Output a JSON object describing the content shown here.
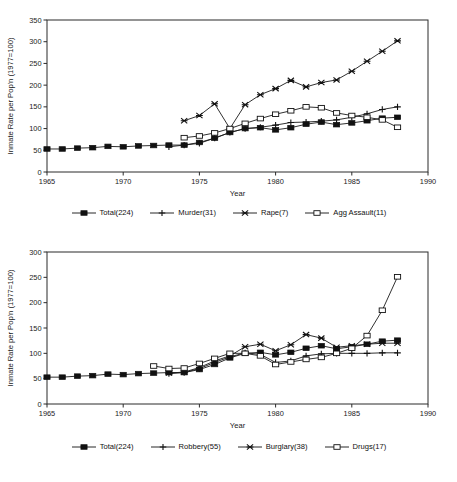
{
  "figure": {
    "background": "#ffffff",
    "ink": "#1a1a1a",
    "clipped_header_text": ""
  },
  "chart_data": [
    {
      "id": "top",
      "type": "line",
      "title": "",
      "xlabel": "Year",
      "ylabel": "Inmate Rate per Pop'n (1977=100)",
      "xlim": [
        1965,
        1990
      ],
      "ylim": [
        0,
        350
      ],
      "xticks": [
        1965,
        1970,
        1975,
        1980,
        1985,
        1990
      ],
      "yticks": [
        0,
        50,
        100,
        150,
        200,
        250,
        300,
        350
      ],
      "grid": false,
      "legend_position": "below",
      "series": [
        {
          "name": "Total(224)",
          "marker": "filled-square",
          "x": [
            1965,
            1966,
            1967,
            1968,
            1969,
            1970,
            1971,
            1972,
            1973,
            1974,
            1975,
            1976,
            1977,
            1978,
            1979,
            1980,
            1981,
            1982,
            1983,
            1984,
            1985,
            1986,
            1987,
            1988
          ],
          "values": [
            53,
            53,
            55,
            56,
            59,
            58,
            60,
            61,
            62,
            62,
            68,
            78,
            91,
            100,
            102,
            97,
            102,
            110,
            115,
            109,
            113,
            118,
            124,
            126
          ]
        },
        {
          "name": "Murder(31)",
          "marker": "plus",
          "x": [
            1973,
            1974,
            1975,
            1976,
            1977,
            1978,
            1979,
            1980,
            1981,
            1982,
            1983,
            1984,
            1985,
            1986,
            1987,
            1988
          ],
          "values": [
            58,
            62,
            66,
            78,
            91,
            100,
            103,
            108,
            114,
            115,
            117,
            120,
            126,
            134,
            144,
            150
          ]
        },
        {
          "name": "Rape(7)",
          "marker": "x",
          "x": [
            1974,
            1975,
            1976,
            1977,
            1978,
            1979,
            1980,
            1981,
            1982,
            1983,
            1984,
            1985,
            1986,
            1987,
            1988
          ],
          "values": [
            118,
            130,
            157,
            100,
            155,
            178,
            192,
            211,
            196,
            206,
            212,
            232,
            255,
            278,
            302,
            348
          ]
        },
        {
          "name": "Agg Assault(11)",
          "marker": "open-square",
          "x": [
            1974,
            1975,
            1976,
            1977,
            1978,
            1979,
            1980,
            1981,
            1982,
            1983,
            1984,
            1985,
            1986,
            1987,
            1988
          ],
          "values": [
            79,
            83,
            90,
            100,
            112,
            123,
            133,
            141,
            150,
            148,
            136,
            130,
            126,
            120,
            103
          ]
        }
      ]
    },
    {
      "id": "bottom",
      "type": "line",
      "title": "",
      "xlabel": "Year",
      "ylabel": "Inmate Rate per Pop'n (1977=100)",
      "xlim": [
        1965,
        1990
      ],
      "ylim": [
        0,
        300
      ],
      "xticks": [
        1965,
        1970,
        1975,
        1980,
        1985,
        1990
      ],
      "yticks": [
        0,
        50,
        100,
        150,
        200,
        250,
        300
      ],
      "grid": false,
      "legend_position": "below",
      "series": [
        {
          "name": "Total(224)",
          "marker": "filled-square",
          "x": [
            1965,
            1966,
            1967,
            1968,
            1969,
            1970,
            1971,
            1972,
            1973,
            1974,
            1975,
            1976,
            1977,
            1978,
            1979,
            1980,
            1981,
            1982,
            1983,
            1984,
            1985,
            1986,
            1987,
            1988
          ],
          "values": [
            53,
            53,
            55,
            56,
            59,
            58,
            60,
            61,
            62,
            62,
            68,
            78,
            91,
            100,
            102,
            97,
            102,
            110,
            115,
            109,
            113,
            118,
            124,
            126
          ]
        },
        {
          "name": "Robbery(55)",
          "marker": "plus",
          "x": [
            1973,
            1974,
            1975,
            1976,
            1977,
            1978,
            1979,
            1980,
            1981,
            1982,
            1983,
            1984,
            1985,
            1986,
            1987,
            1988
          ],
          "values": [
            60,
            62,
            70,
            82,
            93,
            101,
            98,
            82,
            85,
            95,
            99,
            100,
            100,
            100,
            101,
            101
          ]
        },
        {
          "name": "Burglary(38)",
          "marker": "x",
          "x": [
            1973,
            1974,
            1975,
            1976,
            1977,
            1978,
            1979,
            1980,
            1981,
            1982,
            1983,
            1984,
            1985,
            1986,
            1987,
            1988
          ],
          "values": [
            61,
            63,
            72,
            85,
            95,
            113,
            118,
            105,
            117,
            137,
            130,
            112,
            115,
            118,
            120,
            120
          ]
        },
        {
          "name": "Drugs(17)",
          "marker": "open-square",
          "x": [
            1972,
            1973,
            1974,
            1975,
            1976,
            1977,
            1978,
            1979,
            1980,
            1981,
            1982,
            1983,
            1984,
            1985,
            1986,
            1987,
            1988
          ],
          "values": [
            75,
            70,
            71,
            80,
            90,
            100,
            100,
            95,
            78,
            83,
            88,
            92,
            100,
            110,
            135,
            185,
            251
          ]
        }
      ]
    }
  ],
  "legends": {
    "top": [
      {
        "label": "Total(224)",
        "marker": "filled-square"
      },
      {
        "label": "Murder(31)",
        "marker": "plus"
      },
      {
        "label": "Rape(7)",
        "marker": "x"
      },
      {
        "label": "Agg Assault(11)",
        "marker": "open-square"
      }
    ],
    "bottom": [
      {
        "label": "Total(224)",
        "marker": "filled-square"
      },
      {
        "label": "Robbery(55)",
        "marker": "plus"
      },
      {
        "label": "Burglary(38)",
        "marker": "x"
      },
      {
        "label": "Drugs(17)",
        "marker": "open-square"
      }
    ]
  }
}
